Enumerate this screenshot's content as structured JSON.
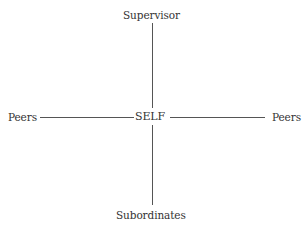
{
  "diagram": {
    "center": {
      "label": "SELF"
    },
    "top": {
      "label": "Supervisor"
    },
    "bottom": {
      "label": "Subordinates"
    },
    "left": {
      "label": "Peers"
    },
    "right": {
      "label": "Peers"
    },
    "line_color": "#555555"
  }
}
